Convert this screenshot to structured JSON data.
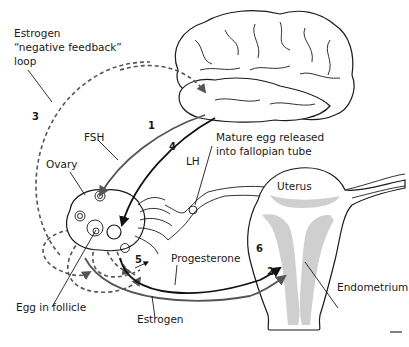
{
  "diagram": {
    "labels": {
      "feedback_line1": "Estrogen",
      "feedback_line2": "“negative feedback”",
      "feedback_line3": "loop",
      "fsh": "FSH",
      "lh": "LH",
      "ovary": "Ovary",
      "mature_egg_line1": "Mature egg released",
      "mature_egg_line2": "into fallopian tube",
      "uterus": "Uterus",
      "progesterone": "Progesterone",
      "endometrium": "Endometrium",
      "egg_in_follicle": "Egg in follicle",
      "estrogen": "Estrogen"
    },
    "steps": {
      "step1": "1",
      "step2": "2",
      "step3": "3",
      "step4": "4",
      "step5": "5",
      "step6": "6"
    },
    "colors": {
      "line_dark": "#111111",
      "line_gray": "#555555",
      "stipple": "#cfcfcf"
    }
  }
}
